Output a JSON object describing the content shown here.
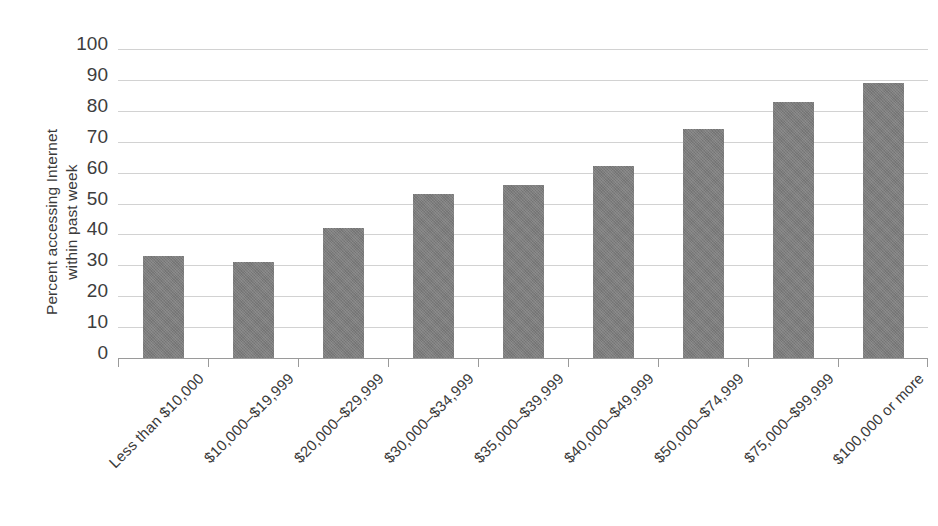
{
  "chart_data": {
    "type": "bar",
    "title": "",
    "subtitle": "",
    "xlabel": "",
    "ylabel": "Percent accessing Internet within past week",
    "ylabel_lines": [
      "Percent accessing Internet",
      "within past week"
    ],
    "categories": [
      "Less than $10,000",
      "$10,000–$19,999",
      "$20,000–$29,999",
      "$30,000–$34,999",
      "$35,000–$39,999",
      "$40,000–$49,999",
      "$50,000–$74,999",
      "$75,000–$99,999",
      "$100,000 or more"
    ],
    "values": [
      33,
      31,
      42,
      53,
      56,
      62,
      74,
      83,
      89
    ],
    "ylim": [
      0,
      100
    ],
    "ytick_values": [
      100,
      90,
      80,
      70,
      60,
      50,
      40,
      30,
      20,
      10,
      0
    ],
    "ytick_labels": [
      "100",
      "90",
      "80",
      "70",
      "60",
      "50",
      "40",
      "30",
      "20",
      "10",
      "0"
    ],
    "ytick_interval": 10,
    "grid": true,
    "grid_axis": "y",
    "legend": false,
    "legend_position": "none",
    "bar_color": "#7d7d7d",
    "gridline_color": "#d2d2d2",
    "axis_color": "#9a9a9a",
    "background_color": "#ffffff",
    "text_color": "#3a3a3a",
    "xtick_label_rotation": -45
  }
}
